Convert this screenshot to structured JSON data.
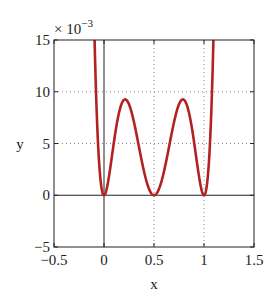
{
  "chart_data": {
    "type": "line",
    "title": "",
    "xlabel": "x",
    "ylabel": "y",
    "y_multiplier": "× 10",
    "y_multiplier_exp": "−3",
    "xlim": [
      -0.5,
      1.5
    ],
    "ylim": [
      -5,
      15
    ],
    "xticks": [
      -0.5,
      0,
      0.5,
      1,
      1.5
    ],
    "xtick_labels": [
      "−0.5",
      "0",
      "0.5",
      "1",
      "1.5"
    ],
    "yticks": [
      -5,
      0,
      5,
      10,
      15
    ],
    "ytick_labels": [
      "−5",
      "0",
      "5",
      "10",
      "15"
    ],
    "grid": true,
    "grid_style": "dotted",
    "axes_lines": {
      "x0": true,
      "y0": true
    },
    "series": [
      {
        "name": "y = x^2 (2x-1)^2 (x-1)^2",
        "color": "#b22222",
        "x": [
          -0.05,
          0,
          0.05,
          0.1,
          0.15,
          0.2,
          0.211,
          0.25,
          0.3,
          0.35,
          0.4,
          0.45,
          0.5,
          0.55,
          0.6,
          0.65,
          0.7,
          0.75,
          0.789,
          0.8,
          0.85,
          0.9,
          0.95,
          1.0,
          1.05
        ],
        "y_e3": [
          3.3,
          0,
          1.84,
          5.18,
          7.83,
          9.22,
          9.23,
          8.79,
          7.06,
          4.97,
          2.88,
          1.21,
          0,
          1.21,
          2.88,
          4.97,
          7.06,
          8.79,
          9.23,
          9.22,
          7.83,
          5.18,
          1.84,
          0,
          3.3
        ]
      }
    ],
    "legend": null
  }
}
